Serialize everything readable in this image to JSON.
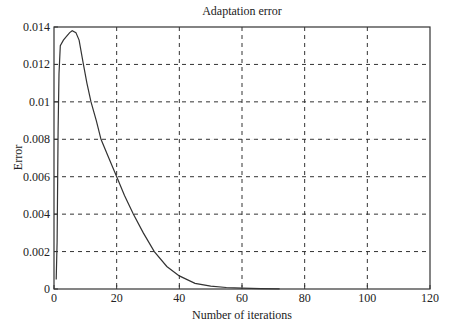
{
  "chart_data": {
    "type": "line",
    "title": "Adaptation error",
    "xlabel": "Number of iterations",
    "ylabel": "Error",
    "xlim": [
      0,
      120
    ],
    "ylim": [
      0,
      0.014
    ],
    "grid": true,
    "xticks": [
      0,
      20,
      40,
      60,
      80,
      100,
      120
    ],
    "yticks": [
      0,
      0.002,
      0.004,
      0.006,
      0.008,
      0.01,
      0.012,
      0.014
    ],
    "xtick_labels": [
      "0",
      "20",
      "40",
      "60",
      "80",
      "100",
      "120"
    ],
    "ytick_labels": [
      "0",
      "0.002",
      "0.004",
      "0.006",
      "0.008",
      "0.01",
      "0.012",
      "0.014"
    ],
    "series": [
      {
        "name": "Adaptation error",
        "x": [
          0.7,
          1.0,
          1.3,
          1.6,
          2,
          3,
          4,
          5,
          5.8,
          7,
          8,
          9.3,
          10.5,
          11.8,
          13.5,
          15,
          17.5,
          20,
          22.5,
          25.3,
          28.5,
          32,
          36,
          40,
          45,
          50,
          55,
          60,
          66,
          72
        ],
        "y": [
          0.0005,
          0.0025,
          0.0085,
          0.0115,
          0.013,
          0.0133,
          0.0135,
          0.0137,
          0.0138,
          0.0137,
          0.0133,
          0.0121,
          0.011,
          0.01,
          0.009,
          0.008,
          0.007,
          0.006,
          0.005,
          0.004,
          0.003,
          0.002,
          0.0012,
          0.0007,
          0.0003,
          0.00015,
          8e-05,
          5e-05,
          2e-05,
          1e-05
        ]
      }
    ],
    "colors": {
      "line": "#333333",
      "grid": "#333333",
      "axes": "#333333"
    }
  }
}
